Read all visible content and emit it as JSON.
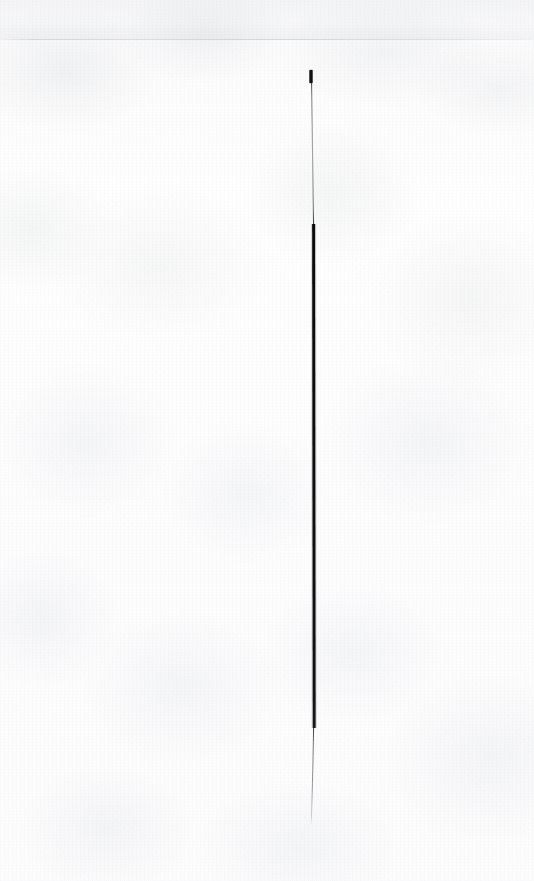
{
  "document": {
    "medium": "scanned-paper",
    "page_width": 534,
    "page_height": 881,
    "paper_color": "#fdfdfd",
    "paper_tint": "#f7f8f9",
    "caption": "",
    "visible_text": ""
  },
  "artifacts": {
    "scan_seam": {
      "name": "faint-horizontal-scan-line",
      "y": 39,
      "color": "#b0b4ba",
      "opacity": "0.38"
    },
    "top_band": {
      "name": "top-edge-tonal-band",
      "height": 40
    },
    "grain": {
      "name": "paper-fibre-grain",
      "color": "#a0a5ac"
    }
  },
  "ink_stroke": {
    "name": "vertical-ink-stroke",
    "color_dark": "#0b0b0c",
    "color_mid": "#3a3a3c",
    "color_light": "#8e9096",
    "top_y": 70,
    "bottom_y": 826,
    "segments": [
      {
        "id": "cap",
        "label": "dark blunt top cap",
        "y_start": 70,
        "y_end": 83,
        "x": 311,
        "width": 3.2,
        "color": "#0d0d0e"
      },
      {
        "id": "upper-shaft",
        "label": "thin grey upper shaft",
        "y_start": 83,
        "y_end": 224,
        "x_start": 311.5,
        "x_end": 313.6,
        "width": 1.1,
        "color": "#83868c"
      },
      {
        "id": "body",
        "label": "thick black body",
        "y_start": 224,
        "y_end": 728,
        "x_start": 313.6,
        "x_end": 314.2,
        "width": 2.9,
        "color": "#0b0b0c"
      },
      {
        "id": "lower-tail",
        "label": "thin grey tapering tail",
        "y_start": 728,
        "y_end": 826,
        "x_start": 313.6,
        "x_end": 311.2,
        "width": 1.0,
        "color": "#7e8187"
      }
    ]
  }
}
